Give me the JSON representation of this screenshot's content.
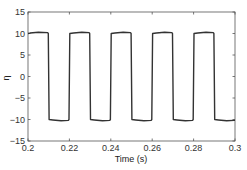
{
  "chart_data": {
    "type": "line",
    "title": "",
    "xlabel": "Time (s)",
    "ylabel": "η",
    "xlim": [
      0.2,
      0.3
    ],
    "ylim": [
      -15,
      15
    ],
    "xticks": [
      0.2,
      0.22,
      0.24,
      0.26,
      0.28,
      0.3
    ],
    "xtick_labels": [
      "0.2",
      "0.22",
      "0.24",
      "0.26",
      "0.28",
      "0.3"
    ],
    "yticks": [
      -15,
      -10,
      -5,
      0,
      5,
      10,
      15
    ],
    "ytick_labels": [
      "-15",
      "-10",
      "-5",
      "0",
      "5",
      "10",
      "15"
    ],
    "grid": false,
    "legend": null,
    "series": [
      {
        "name": "η",
        "color": "#333333",
        "description": "Square wave, period 0.02 s, 50% duty cycle, amplitude ≈ ±10",
        "x": [
          0.2,
          0.201,
          0.205,
          0.2095,
          0.2098,
          0.2102,
          0.212,
          0.216,
          0.2195,
          0.2198,
          0.2202,
          0.222,
          0.226,
          0.2295,
          0.2298,
          0.2302,
          0.232,
          0.236,
          0.2395,
          0.2398,
          0.2402,
          0.242,
          0.246,
          0.2495,
          0.2498,
          0.2502,
          0.252,
          0.256,
          0.2595,
          0.2598,
          0.2602,
          0.262,
          0.266,
          0.2695,
          0.2698,
          0.2702,
          0.272,
          0.276,
          0.2795,
          0.2798,
          0.2802,
          0.282,
          0.286,
          0.2895,
          0.2898,
          0.2902,
          0.292,
          0.296,
          0.2995,
          0.3
        ],
        "y": [
          10.0,
          10.1,
          10.3,
          10.2,
          10.0,
          -10.0,
          -10.1,
          -10.3,
          -10.2,
          -10.0,
          10.0,
          10.1,
          10.3,
          10.2,
          10.0,
          -10.0,
          -10.1,
          -10.3,
          -10.2,
          -10.0,
          10.0,
          10.1,
          10.3,
          10.2,
          10.0,
          -10.0,
          -10.1,
          -10.3,
          -10.2,
          -10.0,
          10.0,
          10.1,
          10.3,
          10.2,
          10.0,
          -10.0,
          -10.1,
          -10.3,
          -10.2,
          -10.0,
          10.0,
          10.1,
          10.3,
          10.2,
          10.0,
          -10.0,
          -10.1,
          -10.3,
          -10.2,
          -10.2
        ]
      }
    ]
  },
  "plot": {
    "left": 28,
    "top": 12,
    "right": 235,
    "bottom": 141
  }
}
